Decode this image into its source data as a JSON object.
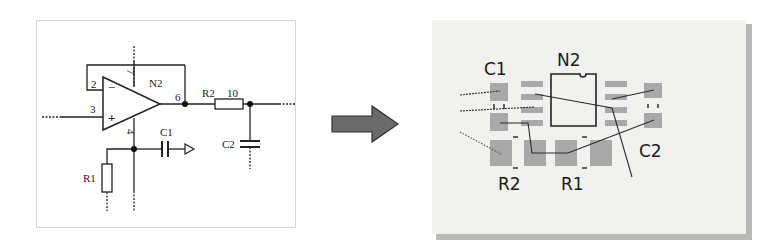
{
  "schematic": {
    "opamp": {
      "ref": "N2",
      "pins": {
        "inverting": "2",
        "non_inverting": "3",
        "output": "6",
        "v_plus": "7",
        "v_minus": "4"
      },
      "inverting_symbol": "−",
      "non_inverting_symbol": "+"
    },
    "components": [
      {
        "ref": "R2",
        "value": "10",
        "type": "resistor"
      },
      {
        "ref": "C1",
        "type": "capacitor"
      },
      {
        "ref": "C2",
        "type": "capacitor"
      },
      {
        "ref": "R1",
        "type": "resistor"
      }
    ],
    "labels": {
      "n2": "N2",
      "pin2": "2",
      "pin3": "3",
      "pin6": "6",
      "pin7": "7",
      "pin4": "4",
      "r2": "R2",
      "r2_value": "10",
      "c1": "C1",
      "c2": "C2",
      "r1": "R1",
      "minus": "−",
      "plus": "+"
    }
  },
  "arrow": {
    "icon": "right-arrow-icon",
    "color": "#6b6b6b"
  },
  "pcb": {
    "labels": {
      "c1": "C1",
      "n2": "N2",
      "c2": "C2",
      "r2": "R2",
      "r1": "R1"
    },
    "colors": {
      "pad": "#a9a9a9",
      "trace": "#2b2b2b",
      "outline": "#222222",
      "board": "#f1f1ef"
    }
  }
}
